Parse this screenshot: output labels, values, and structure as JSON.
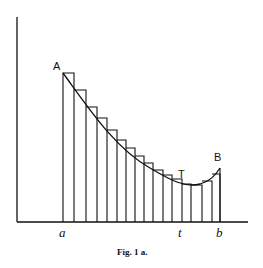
{
  "figure": {
    "caption": "Fig. 1 a.",
    "point_labels": {
      "A": "A",
      "B": "B",
      "T": "T"
    },
    "axis_labels": {
      "a": "a",
      "t": "t",
      "b": "b"
    },
    "colors": {
      "ink": "#111111",
      "background": "#ffffff"
    }
  },
  "diagram": {
    "type": "step-approximation-of-curve",
    "strip_boundaries_x": [
      63,
      74,
      86,
      97,
      107,
      117,
      126,
      135,
      144,
      153,
      163,
      172,
      182,
      191,
      202,
      212,
      220
    ]
  }
}
